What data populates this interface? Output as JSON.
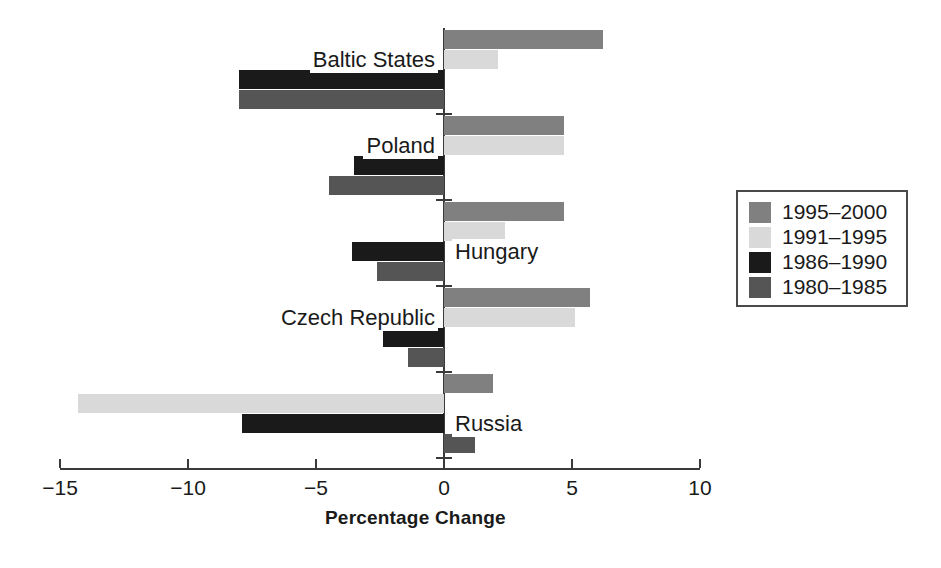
{
  "chart_data": {
    "type": "bar",
    "orientation": "horizontal",
    "title": "",
    "subtitle": "",
    "xlabel": "Percentage Change",
    "ylabel": "",
    "xlim": [
      -15,
      10
    ],
    "xticks": [
      -15,
      -10,
      -5,
      0,
      5,
      10
    ],
    "xticklabels": [
      "−15",
      "−10",
      "−5",
      "0",
      "5",
      "10"
    ],
    "grid": false,
    "legend_position": "right",
    "categories": [
      "Baltic States",
      "Poland",
      "Hungary",
      "Czech Republic",
      "Russia"
    ],
    "series": [
      {
        "name": "1995–2000",
        "color": "#808080",
        "values": [
          6.2,
          4.7,
          4.7,
          5.7,
          1.9
        ]
      },
      {
        "name": "1991–1995",
        "color": "#d9d9d9",
        "values": [
          2.1,
          4.7,
          2.4,
          5.1,
          -14.3
        ]
      },
      {
        "name": "1986–1990",
        "color": "#1a1a1a",
        "values": [
          -8.0,
          -3.5,
          -3.6,
          -2.4,
          -7.9
        ]
      },
      {
        "name": "1980–1985",
        "color": "#555555",
        "values": [
          -8.0,
          -4.5,
          -2.6,
          -1.4,
          1.2
        ]
      }
    ]
  },
  "legend": {
    "entries": [
      {
        "label": "1995–2000"
      },
      {
        "label": "1991–1995"
      },
      {
        "label": "1986–1990"
      },
      {
        "label": "1980–1985"
      }
    ]
  },
  "axis": {
    "x_title": "Percentage Change",
    "tick_labels": [
      "−15",
      "−10",
      "−5",
      "0",
      "5",
      "10"
    ]
  },
  "category_labels": [
    "Baltic States",
    "Poland",
    "Hungary",
    "Czech Republic",
    "Russia"
  ]
}
